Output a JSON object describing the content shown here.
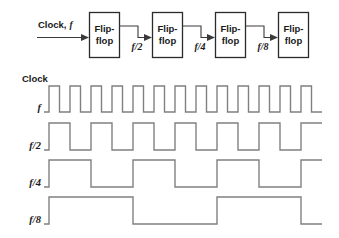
{
  "figure": {
    "background": "#ffffff",
    "box_stroke": "#2b2b2b",
    "wire_stroke": "#5a5a5a",
    "wave_stroke": "#808080",
    "text_color": "#1a1a1a"
  },
  "block_diagram": {
    "input": {
      "label_static": "Clock,",
      "label_italic": "f",
      "arrow_name": "clock-input-arrow"
    },
    "blocks": [
      {
        "line1": "Flip-",
        "line2": "flop"
      },
      {
        "line1": "Flip-",
        "line2": "flop"
      },
      {
        "line1": "Flip-",
        "line2": "flop"
      },
      {
        "line1": "Flip-",
        "line2": "flop"
      }
    ],
    "interconnect_labels": [
      "f/2",
      "f/4",
      "f/8"
    ]
  },
  "waveforms": {
    "heading": "Clock",
    "rows": [
      {
        "label": "f",
        "divisor": 1
      },
      {
        "label": "f/2",
        "divisor": 2
      },
      {
        "label": "f/4",
        "divisor": 4
      },
      {
        "label": "f/8",
        "divisor": 8
      }
    ]
  },
  "chart_data": {
    "type": "line",
    "xlabel": "",
    "ylabel": "",
    "grid": false,
    "legend": "none",
    "x_start_px": 49,
    "x_end_px": 322,
    "clock_half_period_px": 10.5,
    "series": [
      {
        "name": "f",
        "divisor": 1,
        "periods_shown": 13,
        "row_top_px": 86,
        "row_bottom_px": 112,
        "initial_level": "low",
        "first_edge": "rising"
      },
      {
        "name": "f/2",
        "divisor": 2,
        "periods_shown": 6.5,
        "row_top_px": 123,
        "row_bottom_px": 150,
        "initial_level": "low",
        "first_edge": "rising"
      },
      {
        "name": "f/4",
        "divisor": 4,
        "periods_shown": 3.25,
        "row_top_px": 160,
        "row_bottom_px": 187,
        "initial_level": "low",
        "first_edge": "rising"
      },
      {
        "name": "f/8",
        "divisor": 8,
        "periods_shown": 1.6,
        "row_top_px": 197,
        "row_bottom_px": 224,
        "initial_level": "low",
        "first_edge": "rising"
      }
    ]
  }
}
